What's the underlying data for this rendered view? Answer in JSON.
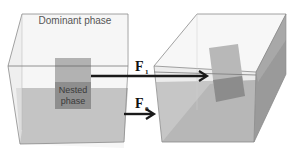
{
  "figure": {
    "left_box": {
      "dominant_label": "Dominant phase",
      "nested_label_line1": "Nested",
      "nested_label_line2": "phase"
    },
    "forces": {
      "f1_label": "F",
      "f1_sub": "1",
      "f0_label": "F",
      "f0_sub": "0"
    },
    "colors": {
      "box_edge": "#8a8a8a",
      "liquid": "#c2c2c2",
      "nested_top": "#b0b0b0",
      "nested_bottom": "#8e8e8e",
      "arrow": "#1a1a1a",
      "right_side_face": "#9a9a9a"
    }
  }
}
